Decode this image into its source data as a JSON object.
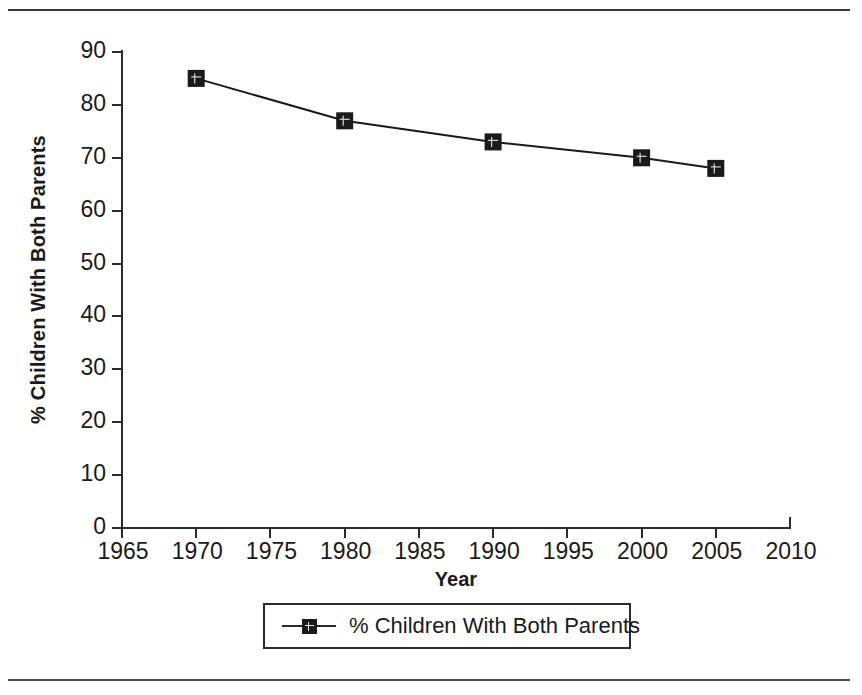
{
  "chart_data": {
    "type": "line",
    "title": "",
    "xlabel": "Year",
    "ylabel": "% Children With Both Parents",
    "xlim": [
      1965,
      2010
    ],
    "ylim": [
      0,
      90
    ],
    "grid": false,
    "legend_position": "bottom",
    "x": [
      1970,
      1980,
      1990,
      2000,
      2005
    ],
    "series": [
      {
        "name": "% Children With Both Parents",
        "values": [
          85,
          77,
          73,
          70,
          68
        ],
        "marker": "filled-square",
        "color": "#1a1a1a"
      }
    ],
    "x_ticks": [
      "1965",
      "1970",
      "1975",
      "1980",
      "1985",
      "1990",
      "1995",
      "2000",
      "2005",
      "2010"
    ],
    "y_ticks": [
      "0",
      "10",
      "20",
      "30",
      "40",
      "50",
      "60",
      "70",
      "80",
      "90"
    ]
  },
  "axes": {
    "y_title": "% Children With Both Parents",
    "x_title": "Year"
  },
  "legend": {
    "entries": [
      {
        "label": "% Children With Both Parents",
        "marker": "line-square-marker"
      }
    ]
  },
  "colors": {
    "ink": "#1a1a1a",
    "axis": "#2b2b2b",
    "rule": "#3a3a3a",
    "background": "#ffffff"
  }
}
